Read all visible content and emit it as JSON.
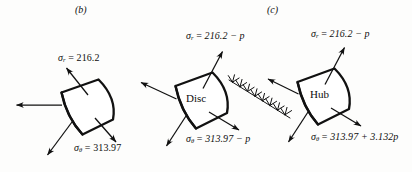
{
  "figure": {
    "background_color": "#fdfdfc",
    "ink_color": "#111111"
  },
  "panels": [
    {
      "caption": "(b)",
      "body_label": "",
      "radial_label": {
        "symbol": "σ",
        "subscript": "r",
        "equals": "=",
        "value": "216.2"
      },
      "hoop_label": {
        "symbol": "σ",
        "subscript": "θ",
        "equals": "=",
        "value": "313.97"
      }
    },
    {
      "caption": "(c)",
      "body_label": "Disc",
      "radial_label": {
        "symbol": "σ",
        "subscript": "r",
        "equals": "=",
        "value": "216.2 − p"
      },
      "hoop_label": {
        "symbol": "σ",
        "subscript": "θ",
        "equals": "=",
        "value": "313.97 − p"
      }
    },
    {
      "caption": "",
      "body_label": "Hub",
      "radial_label": {
        "symbol": "σ",
        "subscript": "r",
        "equals": "=",
        "value": "216.2 − p"
      },
      "hoop_label": {
        "symbol": "σ",
        "subscript": "θ",
        "equals": "=",
        "value": "313.97 + 3.132p"
      }
    }
  ],
  "labels": {
    "caption_b": "(b)",
    "caption_c": "(c)",
    "disc": "Disc",
    "hub": "Hub",
    "sigma": "σ",
    "sub_r": "r",
    "sub_theta": "θ",
    "eq": "=",
    "b_radial_value": "216.2",
    "b_hoop_value": "313.97",
    "disc_radial_value": "216.2 − p",
    "disc_hoop_value": "313.97 − p",
    "hub_radial_value": "216.2 − p",
    "hub_hoop_value": "313.97 + 3.132p"
  }
}
